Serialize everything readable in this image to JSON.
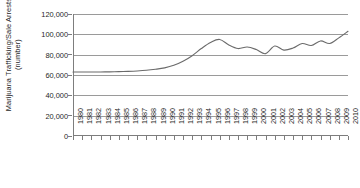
{
  "chart_data": {
    "type": "line",
    "title": "",
    "xlabel": "",
    "ylabel": "Marijuana Trafficking/Sale Arrests\n(number)",
    "ylim": [
      0,
      120000
    ],
    "xlim": [
      1980,
      2010
    ],
    "grid": true,
    "legend": "none",
    "ytick_labels": [
      "120,000",
      "100,000",
      "80,000",
      "60,000",
      "40,000",
      "20,000",
      "0"
    ],
    "ytick_values": [
      120000,
      100000,
      80000,
      60000,
      40000,
      20000,
      0
    ],
    "categories": [
      "1980",
      "1981",
      "1982",
      "1983",
      "1984",
      "1985",
      "1986",
      "1987",
      "1988",
      "1989",
      "1990",
      "1991",
      "1992",
      "1993",
      "1994",
      "1995",
      "1996",
      "1997",
      "1998",
      "1999",
      "2000",
      "2001",
      "2002",
      "2003",
      "2004",
      "2005",
      "2006",
      "2007",
      "2008",
      "2009",
      "2010"
    ],
    "series": [
      {
        "name": "Marijuana Trafficking/Sale Arrests",
        "color": "#6b6b6b",
        "values": [
          63000,
          63000,
          63000,
          63000,
          63100,
          63300,
          63600,
          64000,
          64600,
          65600,
          67000,
          69500,
          73500,
          79000,
          86000,
          92000,
          95000,
          89500,
          86000,
          87500,
          85000,
          81000,
          88500,
          84500,
          86500,
          91000,
          89000,
          93500,
          91000,
          96500,
          103000
        ]
      }
    ]
  }
}
